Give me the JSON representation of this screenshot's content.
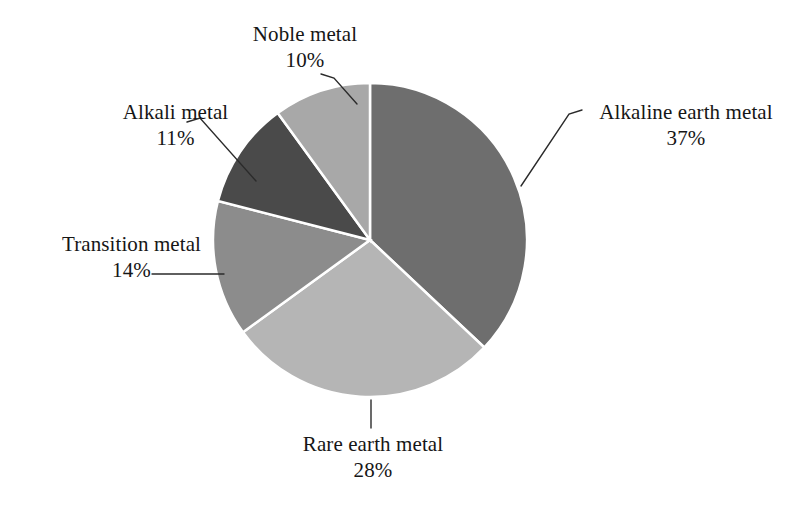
{
  "figure": {
    "background_color": "#ffffff",
    "text_color": "#161616",
    "leader_line_color": "#2b2b2b"
  },
  "chart_data": {
    "type": "pie",
    "title": "",
    "subtitle": "",
    "xlabel": "",
    "ylabel": "",
    "legend_position": "none",
    "grid": false,
    "labels_outside": true,
    "start_angle_deg": 0,
    "direction": "clockwise",
    "categories": [
      "Alkaline earth metal",
      "Rare earth metal",
      "Transition metal",
      "Alkali metal",
      "Noble metal"
    ],
    "values": [
      37,
      28,
      14,
      11,
      10
    ],
    "value_unit": "%",
    "slices": [
      {
        "label": "Alkaline earth metal",
        "value": 37,
        "value_text": "37%",
        "color": "#6e6e6e",
        "start_deg": 0,
        "end_deg": 133.2
      },
      {
        "label": "Rare earth metal",
        "value": 28,
        "value_text": "28%",
        "color": "#b5b5b5",
        "start_deg": 133.2,
        "end_deg": 234.0
      },
      {
        "label": "Transition metal",
        "value": 14,
        "value_text": "14%",
        "color": "#8c8c8c",
        "start_deg": 234.0,
        "end_deg": 284.4
      },
      {
        "label": "Alkali metal",
        "value": 11,
        "value_text": "11%",
        "color": "#4a4a4a",
        "start_deg": 284.4,
        "end_deg": 324.0
      },
      {
        "label": "Noble metal",
        "value": 10,
        "value_text": "10%",
        "color": "#a8a8a8",
        "start_deg": 324.0,
        "end_deg": 360.0
      }
    ]
  }
}
